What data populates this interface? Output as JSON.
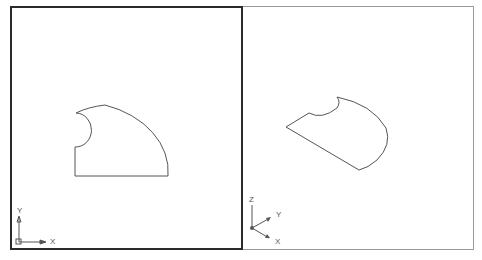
{
  "viewports": [
    {
      "name": "top-view",
      "active": true,
      "ucs": {
        "x_label": "X",
        "y_label": "Y"
      }
    },
    {
      "name": "isometric-view",
      "active": false,
      "ucs": {
        "x_label": "X",
        "y_label": "Y",
        "z_label": "Z"
      }
    }
  ],
  "colors": {
    "background": "#ffffff",
    "geometry": "#555555",
    "active_border": "#2a2a2a",
    "inactive_border": "#9a9a9a"
  }
}
